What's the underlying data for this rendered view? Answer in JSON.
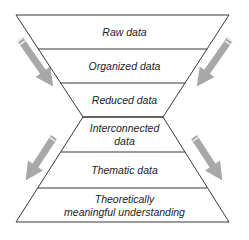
{
  "diagram": {
    "type": "hourglass-funnel",
    "top_funnel": [
      {
        "label": "Raw data"
      },
      {
        "label": "Organized data"
      },
      {
        "label": "Reduced data"
      }
    ],
    "bottom_pyramid": [
      {
        "label_line1": "Interconnected",
        "label_line2": "data"
      },
      {
        "label_line1": "Thematic data",
        "label_line2": ""
      },
      {
        "label_line1": "Theoretically",
        "label_line2": "meaningful understanding"
      }
    ],
    "arrows": [
      {
        "position": "top-left",
        "direction": "down-right"
      },
      {
        "position": "top-right",
        "direction": "down-left"
      },
      {
        "position": "bottom-left",
        "direction": "down-left"
      },
      {
        "position": "bottom-right",
        "direction": "down-right"
      }
    ],
    "colors": {
      "line": "#222222",
      "arrow": "#a8a8a8",
      "background": "#ffffff"
    }
  }
}
